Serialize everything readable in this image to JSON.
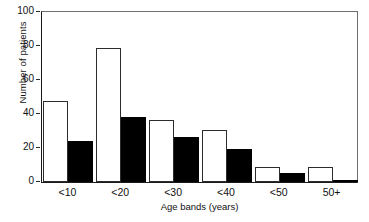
{
  "chart_data": {
    "type": "bar",
    "title": "",
    "xlabel": "Age bands (years)",
    "ylabel": "Number of patients",
    "categories": [
      "<10",
      "<20",
      "<30",
      "<40",
      "<50",
      "50+"
    ],
    "series": [
      {
        "name": "open",
        "style": "white-outline",
        "values": [
          47,
          78,
          36,
          30,
          9,
          9
        ]
      },
      {
        "name": "filled",
        "style": "black-solid",
        "values": [
          24,
          38,
          26,
          19,
          5,
          1
        ]
      }
    ],
    "ylim": [
      0,
      100
    ],
    "yticks": [
      0,
      20,
      40,
      60,
      80,
      100
    ],
    "ytick_labels": [
      "0",
      "20",
      "40",
      "60",
      "80",
      "100"
    ],
    "grid": false,
    "legend": "none"
  },
  "axis": {
    "y_title": "Number of patients",
    "x_title": "Age bands (years)"
  },
  "colors": {
    "open_bar_fill": "#ffffff",
    "open_bar_edge": "#2c2c2c",
    "filled_bar_fill": "#000000",
    "axis": "#1b1b1b",
    "frame": "#6f6f6f",
    "text": "#111111",
    "background": "#ffffff"
  }
}
